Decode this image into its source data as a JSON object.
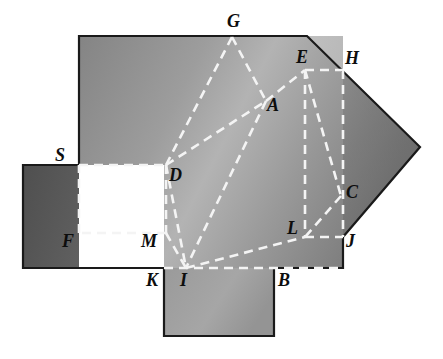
{
  "figure": {
    "background_color": "#ffffff",
    "outline_color": "#1a1a1a",
    "dash_color": "#f2f2f2",
    "fills": {
      "main_body_light": "#b0b0b0",
      "main_body_mid": "#8a8a8a",
      "main_body_dark": "#6e6e6e",
      "left_panel": "#575757",
      "right_wedge": "#6a6a6a",
      "bottom_tab": "#9e9e9e"
    },
    "regions": [
      {
        "name": "main-body",
        "points": "79,36 307,36 420,147 343,237 343,268 274,268 274,268 164,268 164,165 79,165"
      },
      {
        "name": "left-panel",
        "points": "23,165 79,165 79,268 164,268 164,268 23,268"
      },
      {
        "name": "bottom-tab",
        "points": "164,268 274,268 274,336 164,336"
      },
      {
        "name": "right-wedge",
        "points": "307,36 420,147 343,237 343,36"
      }
    ],
    "dashed_segments": [
      {
        "name": "S-D",
        "from": "S",
        "to": "D"
      },
      {
        "name": "S-F",
        "from": "S",
        "to": "F"
      },
      {
        "name": "F-M",
        "from": "F",
        "to": "M"
      },
      {
        "name": "D-M",
        "from": "D",
        "to": "M"
      },
      {
        "name": "G-D",
        "from": "G",
        "to": "D"
      },
      {
        "name": "G-A",
        "from": "G",
        "to": "A"
      },
      {
        "name": "D-A",
        "from": "D",
        "to": "A"
      },
      {
        "name": "A-E",
        "from": "A",
        "to": "E"
      },
      {
        "name": "A-I",
        "from": "A",
        "to": "I"
      },
      {
        "name": "D-I",
        "from": "D",
        "to": "I"
      },
      {
        "name": "M-I",
        "from": "M",
        "to": "I"
      },
      {
        "name": "I-L",
        "from": "I",
        "to": "L"
      },
      {
        "name": "I-B-J",
        "from": "I",
        "to": "J"
      },
      {
        "name": "E-L",
        "from": "E",
        "to": "L"
      },
      {
        "name": "E-H-edge",
        "from": "E",
        "to": "Hcorner"
      },
      {
        "name": "E-C",
        "from": "E",
        "to": "C"
      },
      {
        "name": "L-C",
        "from": "L",
        "to": "C"
      },
      {
        "name": "C-J",
        "from": "C",
        "to": "J"
      },
      {
        "name": "L-J",
        "from": "L",
        "to": "J"
      }
    ],
    "points": {
      "A": {
        "x": 265,
        "y": 100
      },
      "B": {
        "x": 274,
        "y": 268
      },
      "C": {
        "x": 343,
        "y": 195
      },
      "D": {
        "x": 166,
        "y": 165
      },
      "E": {
        "x": 305,
        "y": 70
      },
      "F": {
        "x": 79,
        "y": 233
      },
      "G": {
        "x": 232,
        "y": 37
      },
      "H": {
        "x": 343,
        "y": 70
      },
      "I": {
        "x": 186,
        "y": 268
      },
      "J": {
        "x": 343,
        "y": 237
      },
      "K": {
        "x": 164,
        "y": 268
      },
      "L": {
        "x": 305,
        "y": 237
      },
      "M": {
        "x": 166,
        "y": 233
      },
      "S": {
        "x": 79,
        "y": 165
      }
    },
    "labels": [
      {
        "id": "G",
        "text": "G",
        "x": 227,
        "y": 12
      },
      {
        "id": "E",
        "text": "E",
        "x": 296,
        "y": 48
      },
      {
        "id": "H",
        "text": "H",
        "x": 345,
        "y": 49
      },
      {
        "id": "A",
        "text": "A",
        "x": 267,
        "y": 96
      },
      {
        "id": "S",
        "text": "S",
        "x": 55,
        "y": 146
      },
      {
        "id": "D",
        "text": "D",
        "x": 169,
        "y": 166
      },
      {
        "id": "C",
        "text": "C",
        "x": 346,
        "y": 183
      },
      {
        "id": "F",
        "text": "F",
        "x": 62,
        "y": 232
      },
      {
        "id": "M",
        "text": "M",
        "x": 141,
        "y": 232
      },
      {
        "id": "L",
        "text": "L",
        "x": 287,
        "y": 219
      },
      {
        "id": "J",
        "text": "J",
        "x": 346,
        "y": 232
      },
      {
        "id": "K",
        "text": "K",
        "x": 146,
        "y": 271
      },
      {
        "id": "I",
        "text": "I",
        "x": 180,
        "y": 271
      },
      {
        "id": "B",
        "text": "B",
        "x": 278,
        "y": 271
      }
    ]
  }
}
